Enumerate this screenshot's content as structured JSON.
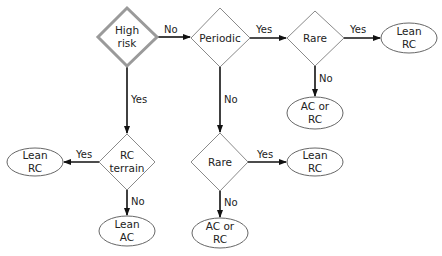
{
  "diagram": {
    "type": "decision-tree flowchart",
    "nodes": [
      {
        "id": "high_risk",
        "shape": "diamond",
        "lines": [
          "High",
          "risk"
        ],
        "start": true
      },
      {
        "id": "periodic",
        "shape": "diamond",
        "lines": [
          "Periodic"
        ]
      },
      {
        "id": "rare_top",
        "shape": "diamond",
        "lines": [
          "Rare"
        ]
      },
      {
        "id": "lean_rc_top",
        "shape": "ellipse",
        "lines": [
          "Lean",
          "RC"
        ]
      },
      {
        "id": "ac_or_rc_top",
        "shape": "ellipse",
        "lines": [
          "AC or",
          "RC"
        ]
      },
      {
        "id": "rc_terrain",
        "shape": "diamond",
        "lines": [
          "RC",
          "terrain"
        ]
      },
      {
        "id": "lean_rc_left",
        "shape": "ellipse",
        "lines": [
          "Lean",
          "RC"
        ]
      },
      {
        "id": "lean_ac",
        "shape": "ellipse",
        "lines": [
          "Lean",
          "AC"
        ]
      },
      {
        "id": "rare_bottom",
        "shape": "diamond",
        "lines": [
          "Rare"
        ]
      },
      {
        "id": "lean_rc_mid",
        "shape": "ellipse",
        "lines": [
          "Lean",
          "RC"
        ]
      },
      {
        "id": "ac_or_rc_bottom",
        "shape": "ellipse",
        "lines": [
          "AC or",
          "RC"
        ]
      }
    ],
    "edges": [
      {
        "from": "high_risk",
        "to": "periodic",
        "label": "No"
      },
      {
        "from": "periodic",
        "to": "rare_top",
        "label": "Yes"
      },
      {
        "from": "rare_top",
        "to": "lean_rc_top",
        "label": "Yes"
      },
      {
        "from": "rare_top",
        "to": "ac_or_rc_top",
        "label": "No"
      },
      {
        "from": "high_risk",
        "to": "rc_terrain",
        "label": "Yes"
      },
      {
        "from": "rc_terrain",
        "to": "lean_rc_left",
        "label": "Yes"
      },
      {
        "from": "rc_terrain",
        "to": "lean_ac",
        "label": "No"
      },
      {
        "from": "periodic",
        "to": "rare_bottom",
        "label": "No"
      },
      {
        "from": "rare_bottom",
        "to": "lean_rc_mid",
        "label": "Yes"
      },
      {
        "from": "rare_bottom",
        "to": "ac_or_rc_bottom",
        "label": "No"
      }
    ]
  },
  "colors": {
    "start_border": "#9a9a9a",
    "diamond_border": "#8a8a8a",
    "ellipse_border": "#555555",
    "arrow": "#111111"
  }
}
